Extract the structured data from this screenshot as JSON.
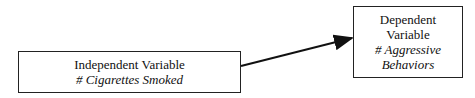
{
  "independent": {
    "title": "Independent Variable",
    "measure": "# Cigarettes Smoked"
  },
  "dependent": {
    "title_line1": "Dependent",
    "title_line2": "Variable",
    "measure_line1": "# Aggressive",
    "measure_line2": "Behaviors"
  },
  "arrow": {
    "from": "independent",
    "to": "dependent",
    "color": "#111111"
  }
}
